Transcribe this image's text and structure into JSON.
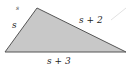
{
  "figure": {
    "type": "triangle",
    "fill_color": "#c8c8c8",
    "stroke_color": "#555555",
    "vertices": {
      "top": [
        37,
        8
      ],
      "bottom_left": [
        5,
        52
      ],
      "bottom_right": [
        126,
        52
      ]
    },
    "labels": {
      "corner_mark": "s",
      "left_side": "s",
      "hypotenuse": "s + 2",
      "base": "s + 3"
    }
  }
}
